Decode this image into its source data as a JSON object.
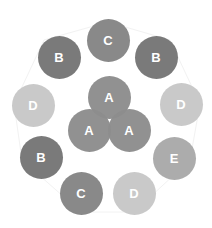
{
  "diagram": {
    "colors": {
      "A": "#8d8d8d",
      "B": "#7a7a7a",
      "C": "#898989",
      "D": "#c9c9c9",
      "E": "#acacac"
    },
    "nodes": [
      {
        "label": "C",
        "x": 108,
        "y": 40
      },
      {
        "label": "B",
        "x": 59,
        "y": 57
      },
      {
        "label": "B",
        "x": 156,
        "y": 57
      },
      {
        "label": "D",
        "x": 33,
        "y": 105
      },
      {
        "label": "D",
        "x": 181,
        "y": 104
      },
      {
        "label": "B",
        "x": 41,
        "y": 157
      },
      {
        "label": "E",
        "x": 174,
        "y": 158
      },
      {
        "label": "C",
        "x": 81,
        "y": 193
      },
      {
        "label": "D",
        "x": 134,
        "y": 193
      },
      {
        "label": "A",
        "x": 109,
        "y": 97
      },
      {
        "label": "A",
        "x": 89,
        "y": 130
      },
      {
        "label": "A",
        "x": 129,
        "y": 130
      }
    ]
  }
}
